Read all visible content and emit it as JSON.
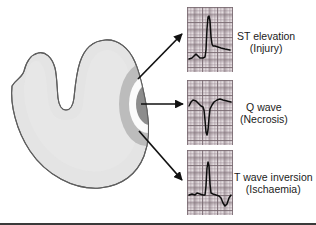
{
  "figure": {
    "background_color": "#ffffff",
    "border_color": "#3a3a3a"
  },
  "heart_diagram": {
    "name": "myocardial-cross-section",
    "description": "Cross-section of left ventricle myocardium with concentric infarct zones",
    "colors": {
      "myocardium_fill": "#e4e4e4",
      "myocardium_outline": "#5a5a5a",
      "ischaemia_zone": "#b9b9b9",
      "injury_zone": "#fbfbfb",
      "necrosis_core": "#8c8c8c"
    },
    "zones": [
      {
        "name": "necrosis-core",
        "label": "Necrosis",
        "color": "#8c8c8c"
      },
      {
        "name": "injury-zone",
        "label": "Injury",
        "color": "#fbfbfb"
      },
      {
        "name": "ischaemia-zone",
        "label": "Ischaemia",
        "color": "#b9b9b9"
      }
    ]
  },
  "arrows": [
    {
      "name": "arrow-to-st-elevation",
      "from": [
        138,
        78
      ],
      "to": [
        184,
        32
      ],
      "target": "ST elevation"
    },
    {
      "name": "arrow-to-q-wave",
      "from": [
        140,
        104
      ],
      "to": [
        184,
        104
      ],
      "target": "Q wave"
    },
    {
      "name": "arrow-to-t-inversion",
      "from": [
        139,
        130
      ],
      "to": [
        184,
        180
      ],
      "target": "T wave inversion"
    }
  ],
  "ecg_panels": [
    {
      "name": "ecg-st-elevation",
      "label_line1": "ST elevation",
      "label_line2": "(Injury)",
      "finding": "ST elevation",
      "clinical_stage": "Injury"
    },
    {
      "name": "ecg-q-wave",
      "label_line1": "Q wave",
      "label_line2": "(Necrosis)",
      "finding": "Q wave",
      "clinical_stage": "Necrosis"
    },
    {
      "name": "ecg-t-wave-inversion",
      "label_line1": "T wave inversion",
      "label_line2": "(Ischaemia)",
      "finding": "T wave inversion",
      "clinical_stage": "Ischaemia"
    }
  ],
  "chart_data": {
    "type": "line",
    "grid": true,
    "xlabel": "",
    "ylabel": "",
    "panel_width": 46,
    "panel_height": 65,
    "series": [
      {
        "name": "ST elevation",
        "points": "2,52 5,51 7,49 9,47 11,49 13,51 16,51 18,50 19,43 20,22 21,10 22,9 23,14 24,30 25,37 26,39 28,39 31,40 34,41 38,42 43,43"
      },
      {
        "name": "Q wave",
        "points": "2,26 4,22 6,20 9,21 12,24 14,26 16,27 17,30 18,40 19,52 20,55 21,50 22,38 23,29 25,25 27,22 30,20 33,19 36,20 40,21 44,22"
      },
      {
        "name": "T wave inversion",
        "points": "2,45 5,44 8,45 10,43 13,44 16,45 18,45 19,36 20,18 21,12 22,16 23,34 24,43 26,44 29,45 32,46 34,48 36,53 38,56 40,54 42,48 44,45"
      }
    ]
  }
}
